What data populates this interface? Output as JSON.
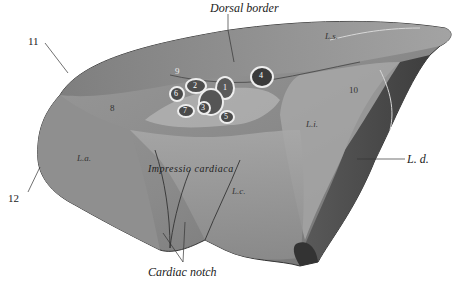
{
  "figure": {
    "labels": {
      "dorsal_border": "Dorsal border",
      "cardiac_notch": "Cardiac notch",
      "impressio_cardiaca": "Impressio cardiaca",
      "ld": "L. d.",
      "la": "L.a.",
      "lc": "L.c.",
      "li": "L.i.",
      "ls": "L.s.",
      "n11": "11",
      "n12": "12",
      "n8": "8",
      "n9": "9",
      "n10": "10",
      "v1": "1",
      "v2": "2",
      "v3": "3",
      "v4": "4",
      "v5": "5",
      "v6": "6",
      "v7": "7"
    },
    "colors": {
      "background": "#ffffff",
      "lung_base": "#8a8a8a",
      "lung_light": "#b8b8b8",
      "lung_dark": "#4a4a4a",
      "vessel_ring": "#e8e8e8",
      "text": "#222222"
    }
  }
}
